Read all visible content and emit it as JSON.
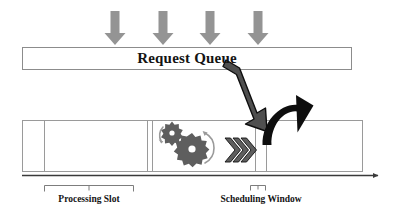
{
  "diagram": {
    "queue": {
      "label": "Request Queue",
      "box": {
        "x": 22,
        "y": 47,
        "width": 330,
        "height": 23
      },
      "fill": "#ffffff",
      "stroke": "#8c8c8c"
    },
    "incoming_arrows": {
      "name": "incoming-request-arrows",
      "count": 4,
      "color": "#8f8f8f",
      "positions_x": [
        115,
        163,
        210,
        258
      ],
      "top_y": 11,
      "tip_y": 45
    },
    "dispatch_arrow": {
      "name": "dispatch-arrow",
      "label": "",
      "fill": "#4f4f4f",
      "stroke": "#111111",
      "from": {
        "x": 228,
        "y": 62
      },
      "to": {
        "x": 266,
        "y": 128
      }
    },
    "curved_arrow": {
      "name": "requeue-curved-arrow",
      "fill": "#111111",
      "from": {
        "x": 262,
        "y": 142
      },
      "to": {
        "x": 302,
        "y": 140
      }
    },
    "gear_group": {
      "name": "processing-gears",
      "color": "#5e5e5e",
      "arc_color": "#8f8f8f",
      "gears": [
        {
          "cx": 172,
          "cy": 133,
          "r": 9,
          "teeth": 8
        },
        {
          "cx": 192,
          "cy": 149,
          "r": 13,
          "teeth": 11
        }
      ]
    },
    "chevrons": {
      "name": "progress-chevrons",
      "count": 3,
      "fill": "#5e5e5e",
      "stroke": "#111111",
      "x_start": 226,
      "y_center": 150
    },
    "track": {
      "name": "timeline-track",
      "x": 22,
      "y": 120,
      "width": 341,
      "height": 52,
      "stroke": "#9a9a9a",
      "fill": "#ffffff",
      "dividers_x": [
        44,
        147,
        152,
        255,
        266
      ]
    },
    "axis": {
      "name": "time-axis",
      "y": 175,
      "x_start": 22,
      "x_end": 382,
      "color": "#3a3a3a"
    },
    "brackets": [
      {
        "name": "processing-slot-bracket",
        "x_start": 44,
        "x_end": 133,
        "y": 184,
        "color": "#7d7d7d"
      },
      {
        "name": "scheduling-window-bracket",
        "x_start": 250,
        "x_end": 265,
        "y": 184,
        "color": "#7d7d7d"
      }
    ],
    "captions": {
      "processing_slot": "Processing Slot",
      "scheduling_window": "Scheduling Window"
    }
  }
}
